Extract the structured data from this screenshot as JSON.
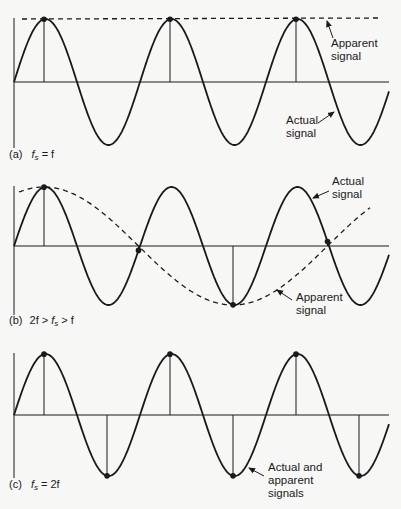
{
  "figure": {
    "colors": {
      "background": "#f7f7f5",
      "ink": "#1a1a1a"
    },
    "geometry": {
      "axis_x": 14,
      "x_end": 389,
      "period_px": 126,
      "first_peak_x": 44,
      "amplitude_px": 63
    },
    "panels": [
      {
        "id": "a",
        "caption_prefix": "(a)",
        "caption_lhs_var": "f",
        "caption_lhs_sub": "s",
        "caption_rest": " = f",
        "caption_full": "(a) fs = f",
        "baseline_y": 82,
        "axis_top": 18,
        "axis_bottom": 148,
        "sample_interval_ratio": 1.0,
        "labels": [
          {
            "id": "apparent",
            "lines": [
              "Apparent",
              "signal"
            ],
            "x": 331,
            "y": 47
          },
          {
            "id": "actual",
            "lines": [
              "Actual",
              "signal"
            ],
            "x": 286,
            "y": 125
          }
        ]
      },
      {
        "id": "b",
        "caption_prefix": "(b)",
        "caption_pre": "2f > ",
        "caption_lhs_var": "f",
        "caption_lhs_sub": "s",
        "caption_rest": " > f",
        "caption_full": "(b) 2f > fs > f",
        "baseline_y": 246,
        "axis_top": 186,
        "axis_bottom": 315,
        "sample_interval_ratio": 0.75,
        "labels": [
          {
            "id": "actual",
            "lines": [
              "Actual",
              "signal"
            ],
            "x": 332,
            "y": 186
          },
          {
            "id": "apparent",
            "lines": [
              "Apparent",
              "signal"
            ],
            "x": 296,
            "y": 300
          }
        ]
      },
      {
        "id": "c",
        "caption_prefix": "(c)",
        "caption_lhs_var": "f",
        "caption_lhs_sub": "s",
        "caption_rest": " = 2f",
        "caption_full": "(c) fs = 2f",
        "baseline_y": 415,
        "axis_top": 353,
        "axis_bottom": 478,
        "sample_interval_ratio": 0.5,
        "labels": [
          {
            "id": "actual-apparent",
            "lines": [
              "Actual and",
              "apparent",
              "signals"
            ],
            "x": 268,
            "y": 472
          }
        ]
      }
    ]
  },
  "chart_data": [
    {
      "type": "line",
      "title": "(a) fs = f",
      "series": [
        {
          "name": "Actual signal",
          "style": "solid",
          "frequency": "f",
          "cycles_shown": 3
        },
        {
          "name": "Apparent signal",
          "style": "dashed",
          "frequency": "0 (DC at peak value)"
        }
      ],
      "sample_points_normalized": [
        [
          0.25,
          1
        ],
        [
          1.25,
          1
        ],
        [
          2.25,
          1
        ]
      ],
      "annotations": [
        "Apparent signal",
        "Actual signal"
      ]
    },
    {
      "type": "line",
      "title": "(b) 2f > fs > f",
      "series": [
        {
          "name": "Actual signal",
          "style": "solid",
          "frequency": "f",
          "cycles_shown": 3
        },
        {
          "name": "Apparent signal",
          "style": "dashed",
          "frequency": "f/3 (alias, fs = 4f/3)"
        }
      ],
      "sample_points_normalized": [
        [
          0.25,
          1
        ],
        [
          1.0,
          0
        ],
        [
          1.75,
          -1
        ],
        [
          2.5,
          0
        ]
      ],
      "annotations": [
        "Actual signal",
        "Apparent signal"
      ]
    },
    {
      "type": "line",
      "title": "(c) fs = 2f",
      "series": [
        {
          "name": "Actual and apparent signals",
          "style": "solid",
          "frequency": "f",
          "cycles_shown": 3
        }
      ],
      "sample_points_normalized": [
        [
          0.25,
          1
        ],
        [
          0.75,
          -1
        ],
        [
          1.25,
          1
        ],
        [
          1.75,
          -1
        ],
        [
          2.25,
          1
        ],
        [
          2.75,
          -1
        ]
      ],
      "annotations": [
        "Actual and apparent signals"
      ]
    }
  ]
}
